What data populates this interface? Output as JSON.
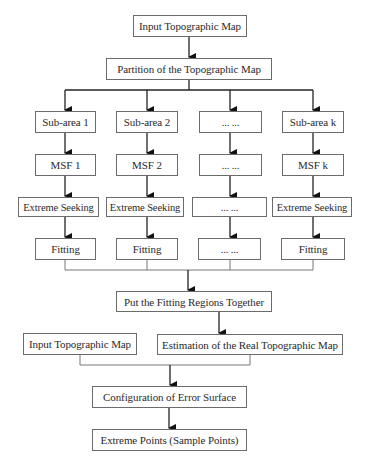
{
  "diagram": {
    "type": "flowchart",
    "colors": {
      "line": "#222222",
      "border": "#6b6b6b",
      "text": "#2a2a2a",
      "background": "#ffffff"
    },
    "top": {
      "input": "Input Topographic Map",
      "partition": "Partition of the Topographic Map"
    },
    "columns": [
      {
        "subarea": "Sub-area 1",
        "msf": "MSF 1",
        "seek": "Extreme Seeking",
        "fit": "Fitting"
      },
      {
        "subarea": "Sub-area 2",
        "msf": "MSF 2",
        "seek": "Extreme Seeking",
        "fit": "Fitting"
      },
      {
        "subarea": "... ...",
        "msf": "... ...",
        "seek": "... ...",
        "fit": "... ..."
      },
      {
        "subarea": "Sub-area k",
        "msf": "MSF k",
        "seek": "Extreme Seeking",
        "fit": "Fitting"
      }
    ],
    "merge": "Put the Fitting Regions Together",
    "input2": "Input Topographic Map",
    "estimation": "Estimation of the Real Topographic Map",
    "configuration": "Configuration of Error Surface",
    "output": "Extreme Points (Sample Points)"
  }
}
